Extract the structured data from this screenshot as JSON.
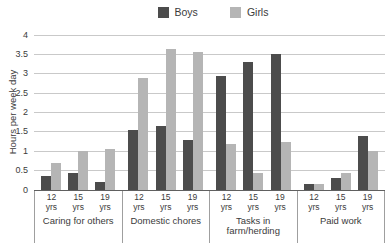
{
  "colors": {
    "boys": "#4c4c4c",
    "girls": "#b5b5b5",
    "gridline": "#c9c9c9",
    "baseline": "#606060",
    "separator": "#9f9f9f",
    "text": "#3b3b3b",
    "background": "#ffffff"
  },
  "chart_data": {
    "type": "bar",
    "title": "",
    "ylabel": "Hours per week day",
    "xlabel": "",
    "ylim": [
      0,
      4
    ],
    "ytick_step": 0.5,
    "ytick_labels": [
      "0",
      "0.5",
      "1",
      "1.5",
      "2",
      "2.5",
      "3",
      "3.5",
      "4"
    ],
    "grid": "horizontal",
    "legend_position": "top",
    "categories": [
      "Caring for others",
      "Domestic chores",
      "Tasks in farm/herding",
      "Paid work"
    ],
    "age_groups": [
      "12 yrs",
      "15 yrs",
      "19 yrs"
    ],
    "series": [
      {
        "name": "Boys",
        "values": [
          [
            0.35,
            0.45,
            0.2
          ],
          [
            1.55,
            1.65,
            1.3
          ],
          [
            2.95,
            3.3,
            3.5
          ],
          [
            0.15,
            0.3,
            1.4
          ]
        ]
      },
      {
        "name": "Girls",
        "values": [
          [
            0.7,
            1.0,
            1.05
          ],
          [
            2.9,
            3.65,
            3.55
          ],
          [
            1.2,
            0.45,
            1.25
          ],
          [
            0.15,
            0.45,
            1.0
          ]
        ]
      }
    ]
  }
}
